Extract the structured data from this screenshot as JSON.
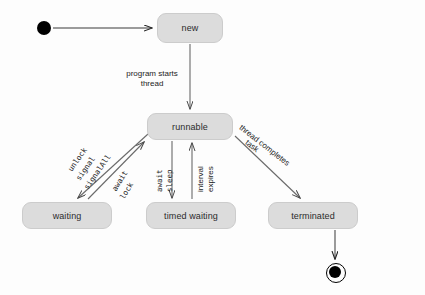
{
  "diagram": {
    "type": "uml-state-machine",
    "colors": {
      "state_fill": "#dcdcdc",
      "state_border": "#cccccc",
      "edge": "#555555",
      "text": "#1c1c1c",
      "background": "#fdfdfd",
      "terminal": "#000000"
    },
    "states": [
      {
        "id": "new",
        "label": "new",
        "x": 157,
        "y": 13,
        "w": 66,
        "h": 30
      },
      {
        "id": "runnable",
        "label": "runnable",
        "x": 147,
        "y": 113,
        "w": 86,
        "h": 27
      },
      {
        "id": "waiting",
        "label": "waiting",
        "x": 22,
        "y": 202,
        "w": 90,
        "h": 27
      },
      {
        "id": "timed_waiting",
        "label": "timed waiting",
        "x": 146,
        "y": 202,
        "w": 90,
        "h": 27
      },
      {
        "id": "terminated",
        "label": "terminated",
        "x": 268,
        "y": 202,
        "w": 90,
        "h": 27
      }
    ],
    "pseudostates": [
      {
        "id": "initial",
        "kind": "initial-node",
        "cx": 44,
        "cy": 28,
        "r": 7
      },
      {
        "id": "final",
        "kind": "final-node",
        "cx": 335,
        "cy": 272,
        "r": 6,
        "ring_r": 9
      }
    ],
    "transitions": [
      {
        "id": "t-initial-new",
        "from": "initial",
        "to": "new",
        "label": ""
      },
      {
        "id": "t-new-runnable",
        "from": "new",
        "to": "runnable",
        "label": "program starts\nthread",
        "label_lines": [
          "program starts",
          "thread"
        ],
        "font": "sans"
      },
      {
        "id": "t-waiting-runnable",
        "from": "waiting",
        "to": "runnable",
        "label": "unlock signal signalAll",
        "label_lines": [
          "unlock",
          "signal",
          "signalAll"
        ],
        "font": "mono"
      },
      {
        "id": "t-runnable-waiting",
        "from": "runnable",
        "to": "waiting",
        "label": "await lock",
        "label_lines": [
          "await",
          "lock"
        ],
        "font": "mono"
      },
      {
        "id": "t-runnable-timed",
        "from": "runnable",
        "to": "timed_waiting",
        "label": "await sleep",
        "label_lines": [
          "await",
          "sleep"
        ],
        "font": "mono"
      },
      {
        "id": "t-timed-runnable",
        "from": "timed_waiting",
        "to": "runnable",
        "label": "interval expires",
        "label_lines": [
          "interval",
          "expires"
        ],
        "font": "sans"
      },
      {
        "id": "t-runnable-terminated",
        "from": "runnable",
        "to": "terminated",
        "label": "thread completes task",
        "label_lines": [
          "thread completes",
          "task"
        ],
        "font": "sans"
      },
      {
        "id": "t-terminated-final",
        "from": "terminated",
        "to": "final",
        "label": ""
      }
    ],
    "labels": {
      "program_starts": "program starts",
      "thread": "thread",
      "unlock": "unlock",
      "signal": "signal",
      "signal_all": "signalAll",
      "await_left": "await",
      "lock": "lock",
      "await_center": "await",
      "sleep": "sleep",
      "interval": "interval",
      "expires": "expires",
      "thread_completes": "thread completes",
      "task": "task"
    }
  }
}
